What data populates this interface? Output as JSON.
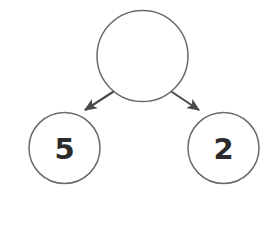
{
  "diagram": {
    "type": "number-bond",
    "background_color": "#ffffff",
    "circle_stroke_color": "#6a6a6a",
    "arrow_color": "#4a4a4a",
    "label_color": "#2b2b2b",
    "whole": {
      "name": "whole-circle",
      "value": "",
      "cx": 142.5,
      "cy": 56,
      "r": 45.5
    },
    "parts": [
      {
        "name": "part-circle-left",
        "value": "5",
        "cx": 64.5,
        "cy": 148,
        "r": 35.5
      },
      {
        "name": "part-circle-right",
        "value": "2",
        "cx": 223.5,
        "cy": 148,
        "r": 35.5
      }
    ],
    "arrows": [
      {
        "name": "arrow-to-left-part",
        "x1": 119,
        "y1": 88,
        "x2": 85,
        "y2": 110
      },
      {
        "name": "arrow-to-right-part",
        "x1": 166,
        "y1": 88,
        "x2": 199,
        "y2": 110
      }
    ]
  }
}
